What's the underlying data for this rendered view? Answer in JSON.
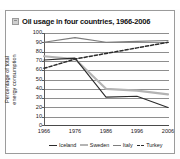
{
  "figure": {
    "title_icon": "image-placeholder-icon",
    "title": "Oil usage in four countries, 1966-2006"
  },
  "chart_data": {
    "type": "line",
    "title": "Oil usage in four countries, 1966-2006",
    "xlabel": "",
    "ylabel": "Percentage of total energy consumption",
    "ylabel_line1": "Percentage of total",
    "ylabel_line2": "energy consumption",
    "x": [
      1966,
      1976,
      1986,
      1996,
      2006
    ],
    "categories": [
      "1966",
      "1976",
      "1986",
      "1996",
      "2006"
    ],
    "xlim": [
      1966,
      2006
    ],
    "ylim": [
      0,
      100
    ],
    "yticks": [
      0,
      10,
      20,
      30,
      40,
      50,
      60,
      70,
      80,
      90,
      100
    ],
    "ytick_labels": [
      "0",
      "10",
      "20",
      "30",
      "40",
      "50",
      "60",
      "70",
      "80",
      "90",
      "100"
    ],
    "grid": true,
    "legend_position": "bottom",
    "series": [
      {
        "name": "Iceland",
        "style": "solid",
        "color": "#2b2b2b",
        "values": [
          71,
          73,
          31,
          32,
          20
        ]
      },
      {
        "name": "Sweden",
        "style": "solid-thick",
        "color": "#b4b4b4",
        "values": [
          75,
          72,
          40,
          38,
          34
        ]
      },
      {
        "name": "Italy",
        "style": "solid",
        "color": "#7d7d7d",
        "values": [
          90,
          95,
          90,
          91,
          92
        ]
      },
      {
        "name": "Turkey",
        "style": "dashed",
        "color": "#2b2b2b",
        "values": [
          62,
          72,
          78,
          84,
          90
        ]
      }
    ],
    "legend": [
      "Iceland",
      "Sweden",
      "Italy",
      "Turkey"
    ]
  },
  "colors": {
    "frame": "#9b9b9b",
    "grid": "#8e8e8e",
    "axis": "#4a4a4a",
    "text": "#1a1a1a",
    "background": "#ffffff"
  }
}
